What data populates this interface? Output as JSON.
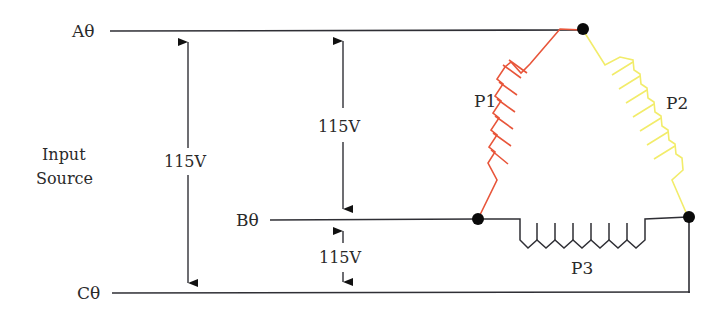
{
  "diagram": {
    "type": "three-phase delta-connected primary winding schematic",
    "input_source_label": [
      "Input",
      "Source"
    ],
    "phases": [
      {
        "id": "A",
        "label": "Aθ"
      },
      {
        "id": "B",
        "label": "Bθ"
      },
      {
        "id": "C",
        "label": "Cθ"
      }
    ],
    "voltages": [
      {
        "between": "A-C",
        "label": "115V"
      },
      {
        "between": "A-B",
        "label": "115V"
      },
      {
        "between": "B-C",
        "label": "115V"
      }
    ],
    "windings": [
      {
        "id": "P1",
        "label": "P1",
        "connects": "A-B",
        "color": "#e8553a"
      },
      {
        "id": "P2",
        "label": "P2",
        "connects": "A-C",
        "color": "#f2ec6a"
      },
      {
        "id": "P3",
        "label": "P3",
        "connects": "B-C",
        "color": "#2f2f35"
      }
    ],
    "colors": {
      "wire": "#2f2f35",
      "node": "#0a0a0a",
      "text": "#2a2a2a"
    }
  }
}
